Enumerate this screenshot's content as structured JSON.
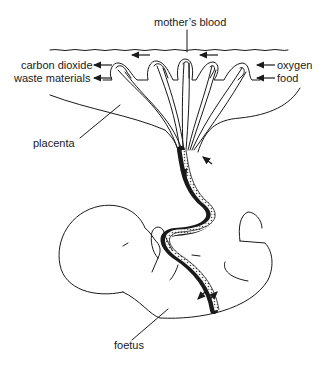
{
  "diagram": {
    "labels": {
      "mothers_blood": "mother’s blood",
      "carbon_dioxide": "carbon dioxide",
      "waste_materials": "waste materials",
      "oxygen": "oxygen",
      "food": "food",
      "placenta": "placenta",
      "foetus": "foetus"
    },
    "flows": [
      {
        "from": "foetus",
        "to": "mother",
        "substance": "carbon dioxide"
      },
      {
        "from": "foetus",
        "to": "mother",
        "substance": "waste materials"
      },
      {
        "from": "mother",
        "to": "foetus",
        "substance": "oxygen"
      },
      {
        "from": "mother",
        "to": "foetus",
        "substance": "food"
      }
    ],
    "parts": [
      "mother's blood",
      "placenta villi",
      "umbilical cord",
      "foetus"
    ],
    "colors": {
      "ink": "#1a1a1a",
      "background": "#ffffff"
    }
  }
}
